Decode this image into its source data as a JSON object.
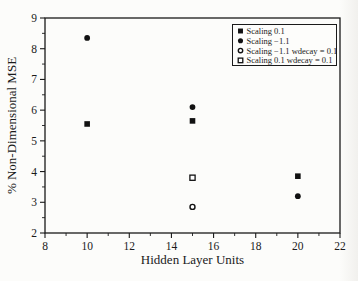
{
  "chart_data": {
    "type": "scatter",
    "title": "",
    "xlabel": "Hidden Layer Units",
    "ylabel": "% Non-Dimensional MSE",
    "xlim": [
      8,
      22
    ],
    "ylim": [
      2,
      9
    ],
    "x_major_ticks": [
      8,
      10,
      12,
      14,
      16,
      18,
      20,
      22
    ],
    "x_minor_ticks": [
      9,
      11,
      13,
      15,
      17,
      19,
      21
    ],
    "y_major_ticks": [
      2,
      3,
      4,
      5,
      6,
      7,
      8,
      9
    ],
    "y_minor_ticks": [
      2.5,
      3.5,
      4.5,
      5.5,
      6.5,
      7.5,
      8.5
    ],
    "grid": false,
    "legend_position": "top-right",
    "series": [
      {
        "name": "Scaling 0.1",
        "marker": "filled-square",
        "points": [
          [
            10,
            5.55
          ],
          [
            15,
            5.65
          ],
          [
            20,
            3.85
          ]
        ]
      },
      {
        "name": "Scaling −1.1",
        "marker": "filled-circle",
        "points": [
          [
            10,
            8.35
          ],
          [
            15,
            6.1
          ],
          [
            20,
            3.2
          ]
        ]
      },
      {
        "name": "Scaling −1.1 wdecay = 0.1",
        "marker": "open-circle",
        "points": [
          [
            15,
            2.85
          ]
        ]
      },
      {
        "name": "Scaling 0.1 wdecay = 0.1",
        "marker": "open-square",
        "points": [
          [
            15,
            3.8
          ]
        ]
      }
    ],
    "colors": {
      "marker": "#111111",
      "axis": "#1a1a1a",
      "background": "#fcfcfa",
      "legend_fill": "#fdfdfb"
    }
  }
}
